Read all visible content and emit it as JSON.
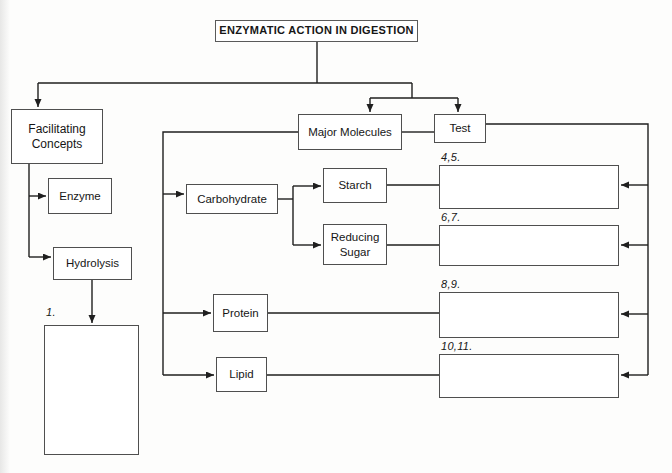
{
  "diagram": {
    "title": "ENZYMATIC ACTION IN DIGESTION",
    "nodes": {
      "facilitating_concepts": {
        "label": "Facilitating Concepts"
      },
      "enzyme": {
        "label": "Enzyme"
      },
      "hydrolysis": {
        "label": "Hydrolysis"
      },
      "major_molecules": {
        "label": "Major Molecules"
      },
      "test": {
        "label": "Test"
      },
      "carbohydrate": {
        "label": "Carbohydrate"
      },
      "starch": {
        "label": "Starch"
      },
      "reducing_sugar": {
        "label": "Reducing Sugar"
      },
      "protein": {
        "label": "Protein"
      },
      "lipid": {
        "label": "Lipid"
      }
    },
    "answer_slots": {
      "s1": {
        "number": "1."
      },
      "s45": {
        "number": "4,5."
      },
      "s67": {
        "number": "6,7."
      },
      "s89": {
        "number": "8,9."
      },
      "s1011": {
        "number": "10,11."
      }
    },
    "colors": {
      "connector": "#1f1f1f",
      "box_border": "#4f4f4f",
      "text": "#161616",
      "background": "#fdfdfc"
    }
  }
}
